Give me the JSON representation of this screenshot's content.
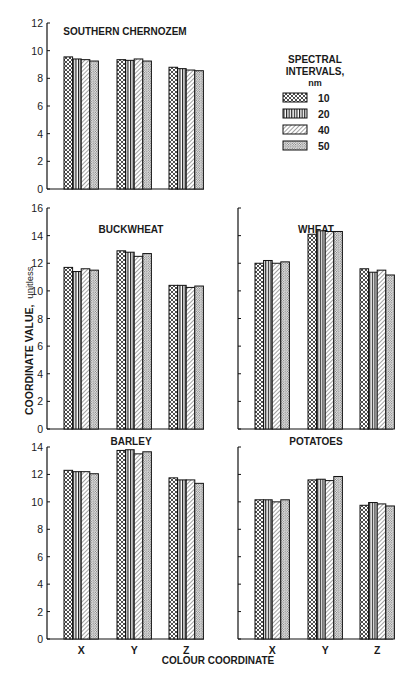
{
  "figure": {
    "y_axis_label": "COORDINATE VALUE,",
    "y_axis_unit": "unitless",
    "x_axis_label": "COLOUR COORDINATE",
    "legend": {
      "title_lines": [
        "SPECTRAL",
        "INTERVALS,",
        "nm"
      ],
      "entries": [
        {
          "label": "10",
          "pattern": "crosshatch"
        },
        {
          "label": "20",
          "pattern": "vertical-lines"
        },
        {
          "label": "40",
          "pattern": "diagonal-lines"
        },
        {
          "label": "50",
          "pattern": "dots"
        }
      ]
    }
  },
  "chart_data": [
    {
      "type": "bar",
      "title": "SOUTHERN CHERNOZEM",
      "categories": [
        "X",
        "Y",
        "Z"
      ],
      "series": [
        {
          "name": "10 nm",
          "values": [
            9.55,
            9.35,
            8.8
          ]
        },
        {
          "name": "20 nm",
          "values": [
            9.4,
            9.3,
            8.7
          ]
        },
        {
          "name": "40 nm",
          "values": [
            9.35,
            9.4,
            8.6
          ]
        },
        {
          "name": "50 nm",
          "values": [
            9.25,
            9.25,
            8.55
          ]
        }
      ],
      "xlabel": "",
      "ylabel": "COORDINATE VALUE, unitless",
      "ylim": [
        0,
        12
      ],
      "yticks": [
        0,
        2,
        4,
        6,
        8,
        10,
        12
      ],
      "grid": false,
      "legend_position": "right"
    },
    {
      "type": "bar",
      "title": "BUCKWHEAT",
      "categories": [
        "X",
        "Y",
        "Z"
      ],
      "series": [
        {
          "name": "10 nm",
          "values": [
            11.7,
            12.9,
            10.4
          ]
        },
        {
          "name": "20 nm",
          "values": [
            11.4,
            12.8,
            10.4
          ]
        },
        {
          "name": "40 nm",
          "values": [
            11.6,
            12.5,
            10.25
          ]
        },
        {
          "name": "50 nm",
          "values": [
            11.5,
            12.7,
            10.35
          ]
        }
      ],
      "xlabel": "",
      "ylabel": "COORDINATE VALUE, unitless",
      "ylim": [
        0,
        16
      ],
      "yticks": [
        0,
        2,
        4,
        6,
        8,
        10,
        12,
        14,
        16
      ],
      "grid": false
    },
    {
      "type": "bar",
      "title": "WHEAT",
      "categories": [
        "X",
        "Y",
        "Z"
      ],
      "series": [
        {
          "name": "10 nm",
          "values": [
            12.0,
            14.1,
            11.6
          ]
        },
        {
          "name": "20 nm",
          "values": [
            12.2,
            14.35,
            11.35
          ]
        },
        {
          "name": "40 nm",
          "values": [
            12.0,
            14.3,
            11.5
          ]
        },
        {
          "name": "50 nm",
          "values": [
            12.1,
            14.3,
            11.15
          ]
        }
      ],
      "xlabel": "",
      "ylabel": "",
      "ylim": [
        0,
        16
      ],
      "yticks": [
        0,
        2,
        4,
        6,
        8,
        10,
        12,
        14,
        16
      ],
      "grid": false
    },
    {
      "type": "bar",
      "title": "BARLEY",
      "categories": [
        "X",
        "Y",
        "Z"
      ],
      "series": [
        {
          "name": "10 nm",
          "values": [
            12.3,
            13.75,
            11.75
          ]
        },
        {
          "name": "20 nm",
          "values": [
            12.2,
            13.8,
            11.6
          ]
        },
        {
          "name": "40 nm",
          "values": [
            12.2,
            13.5,
            11.6
          ]
        },
        {
          "name": "50 nm",
          "values": [
            12.05,
            13.65,
            11.35
          ]
        }
      ],
      "xlabel": "COLOUR COORDINATE",
      "ylabel": "COORDINATE VALUE, unitless",
      "ylim": [
        0,
        14
      ],
      "yticks": [
        0,
        2,
        4,
        6,
        8,
        10,
        12,
        14
      ],
      "grid": false
    },
    {
      "type": "bar",
      "title": "POTATOES",
      "categories": [
        "X",
        "Y",
        "Z"
      ],
      "series": [
        {
          "name": "10 nm",
          "values": [
            10.15,
            11.6,
            9.75
          ]
        },
        {
          "name": "20 nm",
          "values": [
            10.15,
            11.65,
            9.95
          ]
        },
        {
          "name": "40 nm",
          "values": [
            10.0,
            11.55,
            9.85
          ]
        },
        {
          "name": "50 nm",
          "values": [
            10.15,
            11.85,
            9.7
          ]
        }
      ],
      "xlabel": "COLOUR COORDINATE",
      "ylabel": "",
      "ylim": [
        0,
        14
      ],
      "yticks": [
        0,
        2,
        4,
        6,
        8,
        10,
        12,
        14
      ],
      "grid": false
    }
  ]
}
